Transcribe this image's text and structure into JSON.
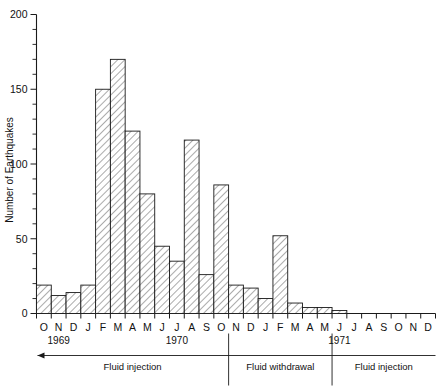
{
  "chart_data": {
    "type": "bar",
    "title": "",
    "xlabel": "",
    "ylabel": "Number of Earthquakes",
    "ylim": [
      0,
      200
    ],
    "yticks": [
      0,
      50,
      100,
      150,
      200
    ],
    "ytick_labels": [
      "0",
      "50",
      "100",
      "150",
      "200"
    ],
    "y_minor_step": 10,
    "grid": false,
    "legend": "none",
    "categories": [
      "O",
      "N",
      "D",
      "J",
      "F",
      "M",
      "A",
      "M",
      "J",
      "J",
      "A",
      "S",
      "O",
      "N",
      "D",
      "J",
      "F",
      "M",
      "A",
      "M",
      "J",
      "J",
      "A",
      "S",
      "O",
      "N",
      "D"
    ],
    "values": [
      19,
      12,
      14,
      19,
      150,
      170,
      122,
      80,
      45,
      35,
      116,
      26,
      86,
      19,
      17,
      10,
      52,
      7,
      4,
      4,
      2,
      0,
      0,
      0,
      0,
      0,
      0
    ],
    "year_labels": [
      {
        "text": "1969",
        "index": 1
      },
      {
        "text": "1970",
        "index": 9
      },
      {
        "text": "1971",
        "index": 20
      }
    ],
    "annotations": [
      {
        "text": "Fluid injection",
        "start_index": 0,
        "end_index": 12
      },
      {
        "text": "Fluid withdrawal",
        "start_index": 13,
        "end_index": 19
      },
      {
        "text": "Fluid injection",
        "start_index": 20,
        "end_index": 26
      }
    ],
    "separator_indices": [
      13,
      20
    ],
    "colors": {
      "axis": "#1a1a1a",
      "bar_stroke": "#1a1a1a",
      "bar_fill": "#ffffff",
      "hatch": "#555555",
      "background": "#ffffff"
    }
  }
}
